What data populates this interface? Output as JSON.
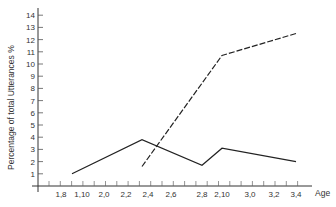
{
  "chart_data": {
    "type": "line",
    "title": "",
    "xlabel": "Age",
    "ylabel": "Percentage of total Utterances %",
    "ylim": [
      0,
      14
    ],
    "y_ticks": [
      "1",
      "2",
      "3",
      "4",
      "5",
      "6",
      "7",
      "8",
      "9",
      "10",
      "11",
      "12",
      "13",
      "14"
    ],
    "x_tick_labels": [
      "1,8",
      "1,10",
      "2,0",
      "2,2",
      "2,4",
      "2,6",
      "2,8",
      "2,10",
      "3,0",
      "3,2",
      "3,4"
    ],
    "grid": false,
    "legend": null,
    "series": [
      {
        "name": "solid",
        "style": "solid",
        "points": [
          {
            "x": "1,9",
            "y": 1.0
          },
          {
            "x": "2,3",
            "y": 3.8
          },
          {
            "x": "2,8",
            "y": 1.7
          },
          {
            "x": "2,10",
            "y": 3.1
          },
          {
            "x": "3,4",
            "y": 2.0
          }
        ]
      },
      {
        "name": "dashed",
        "style": "dashed",
        "points": [
          {
            "x": "2,3",
            "y": 1.6
          },
          {
            "x": "2,10",
            "y": 10.7
          },
          {
            "x": "3,4",
            "y": 12.5
          }
        ]
      }
    ]
  },
  "labels": {
    "xlabel": "Age",
    "ylabel": "Percentage of total Utterances %"
  }
}
